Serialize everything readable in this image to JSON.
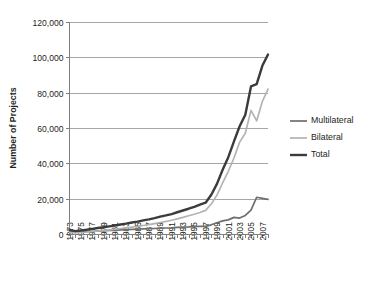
{
  "chart_data": {
    "type": "line",
    "title": "",
    "xlabel": "",
    "ylabel": "Number of Projects",
    "ylim": [
      0,
      120000
    ],
    "xlim": [
      1973,
      2008
    ],
    "grid": true,
    "legend_position": "right",
    "ytick_labels": [
      "0",
      "20,000",
      "40,000",
      "60,000",
      "80,000",
      "100,000",
      "120,000"
    ],
    "ytick_values": [
      0,
      20000,
      40000,
      60000,
      80000,
      100000,
      120000
    ],
    "xtick_labels": [
      "1973",
      "1975",
      "1977",
      "1979",
      "1981",
      "1983",
      "1985",
      "1987",
      "1989",
      "1991",
      "1993",
      "1995",
      "1997",
      "1999",
      "2001",
      "2003",
      "2005",
      "2007"
    ],
    "x": [
      1973,
      1974,
      1975,
      1976,
      1977,
      1978,
      1979,
      1980,
      1981,
      1982,
      1983,
      1984,
      1985,
      1986,
      1987,
      1988,
      1989,
      1990,
      1991,
      1992,
      1993,
      1994,
      1995,
      1996,
      1997,
      1998,
      1999,
      2000,
      2001,
      2002,
      2003,
      2004,
      2005,
      2006,
      2007,
      2008
    ],
    "series": [
      {
        "name": "Multilateral",
        "color": "#6e6e6e",
        "width": 1.7,
        "values": [
          1400,
          900,
          1100,
          1300,
          1500,
          1700,
          1800,
          2000,
          2100,
          2300,
          2400,
          2600,
          2700,
          2900,
          3000,
          3100,
          3300,
          3400,
          3500,
          3700,
          3900,
          4000,
          4200,
          4400,
          4300,
          5200,
          6400,
          7400,
          8000,
          9400,
          9000,
          10500,
          13500,
          20800,
          20200,
          19600
        ]
      },
      {
        "name": "Bilateral",
        "color": "#b3b3b3",
        "width": 1.7,
        "values": [
          900,
          700,
          900,
          1100,
          1400,
          1700,
          2000,
          2300,
          2700,
          3100,
          3500,
          3900,
          4300,
          4800,
          5300,
          5900,
          6500,
          7100,
          7800,
          8600,
          9400,
          10300,
          11200,
          12200,
          13400,
          17000,
          22000,
          29000,
          35500,
          43000,
          52000,
          57000,
          70000,
          64000,
          75000,
          82000
        ]
      },
      {
        "name": "Total",
        "color": "#3b3b3b",
        "width": 2.4,
        "values": [
          2300,
          1600,
          2000,
          2400,
          2900,
          3400,
          3800,
          4300,
          4800,
          5400,
          5900,
          6500,
          7000,
          7700,
          8300,
          9000,
          9800,
          10500,
          11300,
          12300,
          13300,
          14300,
          15400,
          16600,
          17700,
          22200,
          28400,
          36400,
          43500,
          52400,
          61000,
          67500,
          83500,
          84800,
          95200,
          101600
        ]
      }
    ]
  },
  "legend": {
    "items": [
      {
        "label": "Multilateral"
      },
      {
        "label": "Bilateral"
      },
      {
        "label": "Total"
      }
    ]
  }
}
